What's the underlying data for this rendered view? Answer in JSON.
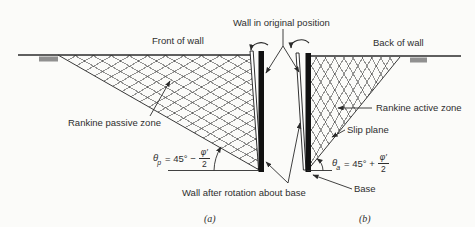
{
  "figure": {
    "top_labels": {
      "wall_original": "Wall in original position",
      "front_of_wall": "Front of wall",
      "back_of_wall": "Back of wall"
    },
    "zone_labels": {
      "rankine_passive": "Rankine passive zone",
      "rankine_active": "Rankine active zone",
      "slip_plane": "Slip plane"
    },
    "bottom_labels": {
      "wall_after_rotation": "Wall after rotation about base",
      "base": "Base",
      "sub_a": "(a)",
      "sub_b": "(b)"
    },
    "formulas": {
      "passive": {
        "theta": "θ",
        "sub": "p",
        "eq": "= 45° −",
        "num": "φ′",
        "den": "2"
      },
      "active": {
        "theta": "θ",
        "sub": "a",
        "eq": "= 45° +",
        "num": "φ′",
        "den": "2"
      }
    },
    "colors": {
      "background": "#fbfbf9",
      "line": "#2b2b2b",
      "hatch_line": "#6f6f6f",
      "ground_marker": "#909090",
      "wall_fill": "#111111",
      "text": "#2e2e2e"
    }
  }
}
